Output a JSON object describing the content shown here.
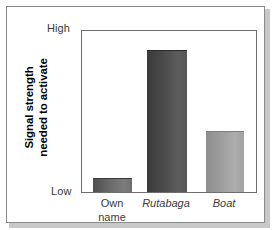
{
  "chart_data": {
    "type": "bar",
    "title": "",
    "xlabel": "",
    "ylabel": "Signal strength needed to activate",
    "ylabel_line1": "Signal strength",
    "ylabel_line2": "needed to activate",
    "categories": [
      "Own\nname",
      "Rutabaga",
      "Boat"
    ],
    "category_labels": [
      {
        "text": "Own\nname",
        "style": "normal"
      },
      {
        "text": "Rutabaga",
        "style": "italic"
      },
      {
        "text": "Boat",
        "style": "italic"
      }
    ],
    "values": [
      8.6,
      88.3,
      38.0
    ],
    "ylim": [
      0,
      100
    ],
    "ytick_labels": [
      "Low",
      "High"
    ],
    "ytick_low": "Low",
    "ytick_high": "High",
    "grid": false,
    "legend": null,
    "bar_colors": [
      "#6b6b6b",
      "#4a4a4a",
      "#9b9b9b"
    ]
  }
}
